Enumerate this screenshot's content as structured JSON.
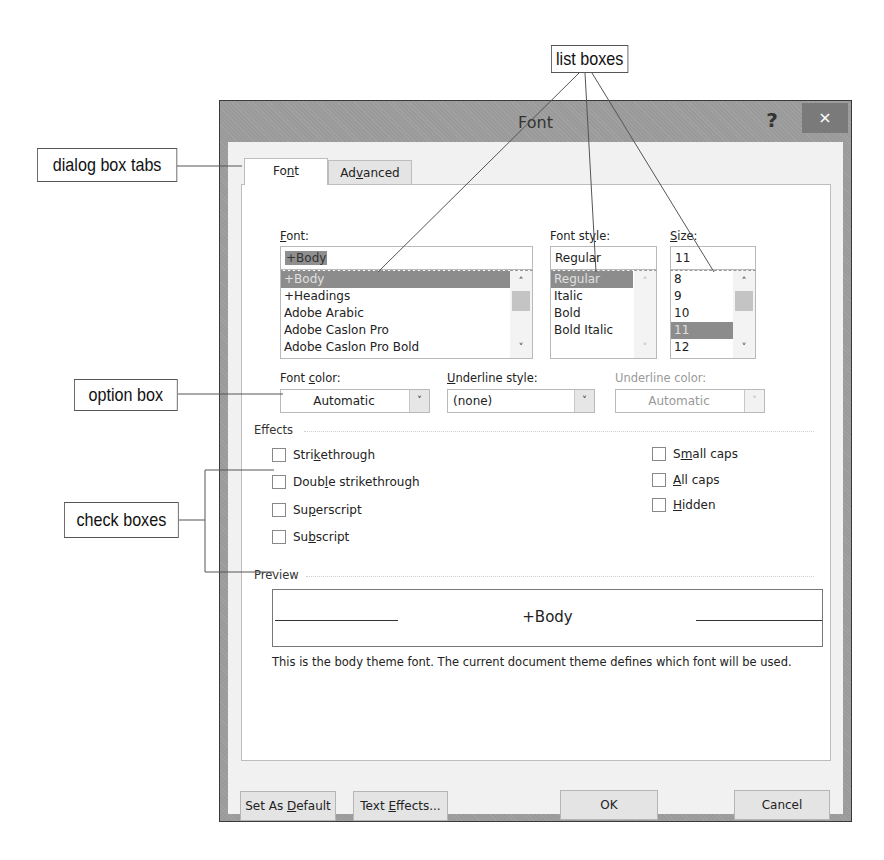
{
  "callouts": {
    "list_boxes": "list boxes",
    "dialog_box_tabs": "dialog box tabs",
    "option_box": "option box",
    "check_boxes": "check boxes"
  },
  "dialog": {
    "title": "Font",
    "help_icon": "?",
    "close_icon": "×",
    "tabs": [
      {
        "label_pre": "Fo",
        "label_u": "n",
        "label_post": "t",
        "active": true
      },
      {
        "label_pre": "Ad",
        "label_u": "v",
        "label_post": "anced",
        "active": false
      }
    ],
    "font": {
      "label_u": "F",
      "label_post": "ont:",
      "value": "+Body",
      "items": [
        "+Body",
        "+Headings",
        "Adobe Arabic",
        "Adobe Caslon Pro",
        "Adobe Caslon Pro Bold"
      ],
      "selected_index": 0
    },
    "font_style": {
      "label_pre": "Font st",
      "label_u": "y",
      "label_post": "le:",
      "value": "Regular",
      "items": [
        "Regular",
        "Italic",
        "Bold",
        "Bold Italic"
      ],
      "selected_index": 0
    },
    "size": {
      "label_u": "S",
      "label_post": "ize:",
      "value": "11",
      "items": [
        "8",
        "9",
        "10",
        "11",
        "12"
      ],
      "selected_index": 3
    },
    "font_color": {
      "label_pre": "Font ",
      "label_u": "c",
      "label_post": "olor:",
      "value": "Automatic"
    },
    "underline_style": {
      "label_u": "U",
      "label_post": "nderline style:",
      "value": "(none)"
    },
    "underline_color": {
      "label": "Underline color:",
      "value": "Automatic",
      "disabled": true
    },
    "effects": {
      "heading": "Effects",
      "left": [
        {
          "pre": "Stri",
          "u": "k",
          "post": "ethrough",
          "checked": false
        },
        {
          "pre": "Doub",
          "u": "l",
          "post": "e strikethrough",
          "checked": false
        },
        {
          "pre": "Su",
          "u": "p",
          "post": "erscript",
          "checked": false
        },
        {
          "pre": "Su",
          "u": "b",
          "post": "script",
          "checked": false
        }
      ],
      "right": [
        {
          "pre": "S",
          "u": "m",
          "post": "all caps",
          "checked": false
        },
        {
          "pre": "",
          "u": "A",
          "post": "ll caps",
          "checked": false
        },
        {
          "pre": "",
          "u": "H",
          "post": "idden",
          "checked": false
        }
      ]
    },
    "preview": {
      "heading": "Preview",
      "sample": "+Body",
      "note": "This is the body theme font. The current document theme defines which font will be used."
    },
    "buttons": {
      "set_default": {
        "pre": "Set As ",
        "u": "D",
        "post": "efault"
      },
      "text_effects": {
        "pre": "Text ",
        "u": "E",
        "post": "ffects..."
      },
      "ok": "OK",
      "cancel": "Cancel"
    }
  }
}
